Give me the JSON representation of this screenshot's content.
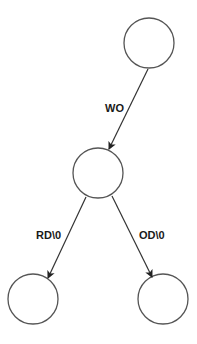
{
  "diagram": {
    "type": "tree",
    "nodes": [
      {
        "id": "n0",
        "cx": 149,
        "cy": 43,
        "r": 25,
        "label": ""
      },
      {
        "id": "n1",
        "cx": 98,
        "cy": 173,
        "r": 25,
        "label": ""
      },
      {
        "id": "n2",
        "cx": 33,
        "cy": 299,
        "r": 25,
        "label": ""
      },
      {
        "id": "n3",
        "cx": 163,
        "cy": 299,
        "r": 25,
        "label": ""
      }
    ],
    "edges": [
      {
        "from": "n0",
        "to": "n1",
        "label": "WO"
      },
      {
        "from": "n1",
        "to": "n2",
        "label": "RD\\0"
      },
      {
        "from": "n1",
        "to": "n3",
        "label": "OD\\0"
      }
    ],
    "colors": {
      "stroke": "#555555",
      "text": "#1a1a1a",
      "background": "#ffffff"
    }
  }
}
